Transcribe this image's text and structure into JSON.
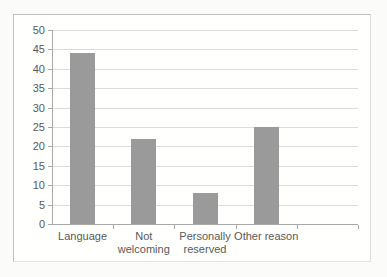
{
  "chart_data": {
    "type": "bar",
    "title": "",
    "categories": [
      "Language",
      "Not welcoming",
      "Personally reserved",
      "Other reason"
    ],
    "values": [
      44,
      22,
      8,
      25
    ],
    "xlabel": "",
    "ylabel": "",
    "ylim": [
      0,
      50
    ],
    "yticks": [
      0,
      5,
      10,
      15,
      20,
      25,
      30,
      35,
      40,
      45,
      50
    ],
    "grid": true,
    "legend": "none",
    "empty_trailing_slots": 1,
    "colors": {
      "bar": "#9a9a9a",
      "gridline": "#dcdcdc",
      "axis": "#a8a8a8",
      "text": "#595959",
      "frame_border": "#c0c0c0",
      "frame_background": "#fffffe",
      "page_background": "#fbfbf9"
    }
  }
}
